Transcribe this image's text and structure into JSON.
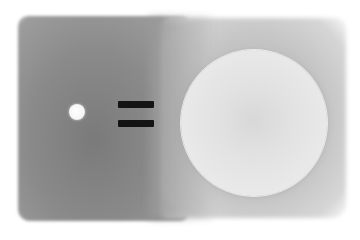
{
  "scene": {
    "description": "Painted grayscale illustration: small white dot equals large pale circle",
    "left_panel": {
      "color": "#8a8a8a"
    },
    "right_panel": {
      "color": "#c8c8c8"
    },
    "small_dot": {
      "color": "#f8f8f8",
      "cx": 77,
      "cy": 112,
      "r": 8
    },
    "equals_sign": {
      "color": "#141414",
      "glyph": "="
    },
    "large_circle": {
      "color": "#e6e6e6",
      "cx": 254,
      "cy": 123,
      "r": 73
    }
  }
}
